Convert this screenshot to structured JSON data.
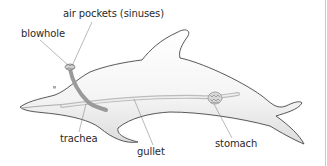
{
  "figure": {
    "labels": [
      {
        "id": "air-pockets",
        "text": "air pockets (sinuses)"
      },
      {
        "id": "blowhole",
        "text": "blowhole"
      },
      {
        "id": "trachea",
        "text": "trachea"
      },
      {
        "id": "gullet",
        "text": "gullet"
      },
      {
        "id": "stomach",
        "text": "stomach"
      }
    ]
  },
  "colors": {
    "outline": "#4a4a4a",
    "body_shade": "#e6e6e6",
    "organ": "#9a9a9a",
    "leader": "#8a8a8a",
    "text": "#2a2a2a"
  }
}
